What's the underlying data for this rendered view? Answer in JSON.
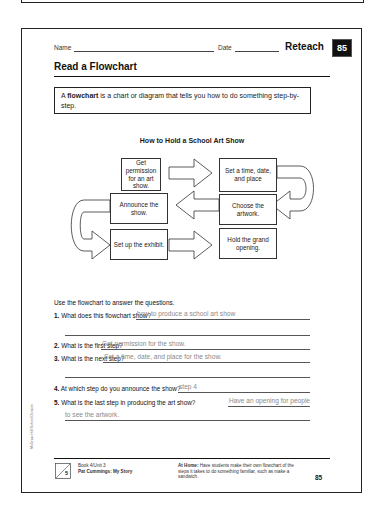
{
  "header": {
    "name_label": "Name",
    "date_label": "Date",
    "reteach_label": "Reteach",
    "page_badge": "85"
  },
  "title": "Read a Flowchart",
  "definition": {
    "term": "flowchart",
    "prefix": "A ",
    "rest": " is a chart or diagram that tells you how to do something step-by-step."
  },
  "flowchart": {
    "title": "How to Hold a School Art Show",
    "steps": [
      "Get permission for an art show.",
      "Set a time, date, and place",
      "Choose the artwork.",
      "Announce the show.",
      "Set up the exhibit.",
      "Hold the grand opening."
    ],
    "arrows": [
      "right",
      "curve-down-left",
      "left",
      "curve-down-right",
      "right"
    ]
  },
  "instructions": "Use the flowchart to answer the questions.",
  "questions": [
    {
      "num": "1.",
      "text": "What does this flowchart show?",
      "answer": "how to produce a school art show",
      "answer_cont": ""
    },
    {
      "num": "2.",
      "text": "What is the first step?",
      "answer": "Get permission for the show.",
      "answer_cont": ""
    },
    {
      "num": "3.",
      "text": "What is the next step?",
      "answer": "Set a time, date, and place for the show.",
      "answer_cont": ""
    },
    {
      "num": "4.",
      "text": "At which step do you announce the show?",
      "answer": "step 4",
      "answer_cont": ""
    },
    {
      "num": "5.",
      "text": "What is the last step in producing the art show?",
      "answer": "Have an opening for people",
      "answer_cont": "to see the artwork."
    }
  ],
  "side_credit": "McGraw-Hill School Division",
  "footer": {
    "unit_number": "5",
    "book_unit": "Book 4/Unit 3",
    "story": "Pat Cummings: My Story",
    "at_home_label": "At Home:",
    "at_home_text": "Have students make their own flowchart of the steps it takes to do something familiar, such as make a sandwich.",
    "page_number": "85"
  }
}
